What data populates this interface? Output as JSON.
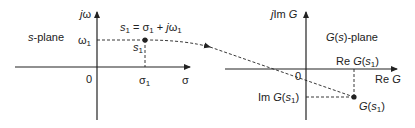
{
  "left_plane": {
    "name": "s-plane",
    "name_italic": "s",
    "name_rest": "-plane",
    "y_axis_label_j": "j",
    "y_axis_label_var": "ω",
    "x_axis_label": "σ",
    "origin_label": "0",
    "omega1_label": "ω",
    "omega1_sub": "1",
    "sigma1_label": "σ",
    "sigma1_sub": "1",
    "point_label": "s",
    "point_sub": "1",
    "equation": {
      "lhs": "s",
      "lhs_sub": "1",
      "eq": " = σ",
      "sigma_sub": "1",
      "plus": " + ",
      "j": "j",
      "omega": "ω",
      "omega_sub": "1"
    }
  },
  "right_plane": {
    "name_italic_G": "G",
    "name_paren": "(",
    "name_s": "s",
    "name_rest": ")-plane",
    "y_axis_label_j": "j",
    "y_axis_label_im": "Im ",
    "y_axis_label_G": "G",
    "x_axis_label_re": "Re ",
    "x_axis_label_G": "G",
    "origin_label": "0",
    "re_value_label": {
      "prefix": "Re ",
      "G": "G",
      "open": "(",
      "s": "s",
      "sub": "1",
      "close": ")"
    },
    "im_value_label": {
      "prefix": "Im ",
      "G": "G",
      "open": "(",
      "s": "s",
      "sub": "1",
      "close": ")"
    },
    "point_label": {
      "G": "G",
      "open": "(",
      "s": "s",
      "sub": "1",
      "close": ")"
    }
  },
  "colors": {
    "ink": "#222222",
    "background": "#ffffff"
  }
}
